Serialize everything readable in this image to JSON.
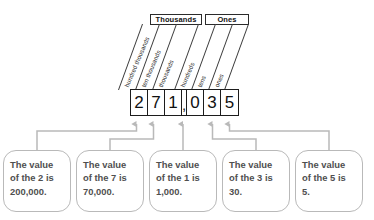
{
  "diagram": {
    "number": "271,035",
    "groups": [
      {
        "label": "Thousands"
      },
      {
        "label": "Ones"
      }
    ],
    "place_labels": [
      "hundred thousands",
      "ten thousands",
      "thousands",
      "hundreds",
      "tens",
      "ones"
    ],
    "digits": [
      {
        "value": "2"
      },
      {
        "value": "7"
      },
      {
        "value": "1"
      },
      {
        "value": "0"
      },
      {
        "value": "3"
      },
      {
        "value": "5"
      }
    ],
    "separator": ",",
    "callouts": [
      {
        "line1": "The value",
        "line2": "of the 2 is",
        "line3": "200,000."
      },
      {
        "line1": "The value",
        "line2": "of the 7 is",
        "line3": "70,000."
      },
      {
        "line1": "The value",
        "line2": "of the 1 is",
        "line3": "1,000."
      },
      {
        "line1": "The value",
        "line2": "of the 3 is",
        "line3": "30."
      },
      {
        "line1": "The value",
        "line2": "of the 5 is",
        "line3": "5."
      }
    ],
    "colors": {
      "ink": "#1c1c1c",
      "text": "#4f4f4f",
      "connector": "#b9b9b9",
      "callout_border": "#b9b9b9",
      "background": "#ffffff"
    }
  }
}
